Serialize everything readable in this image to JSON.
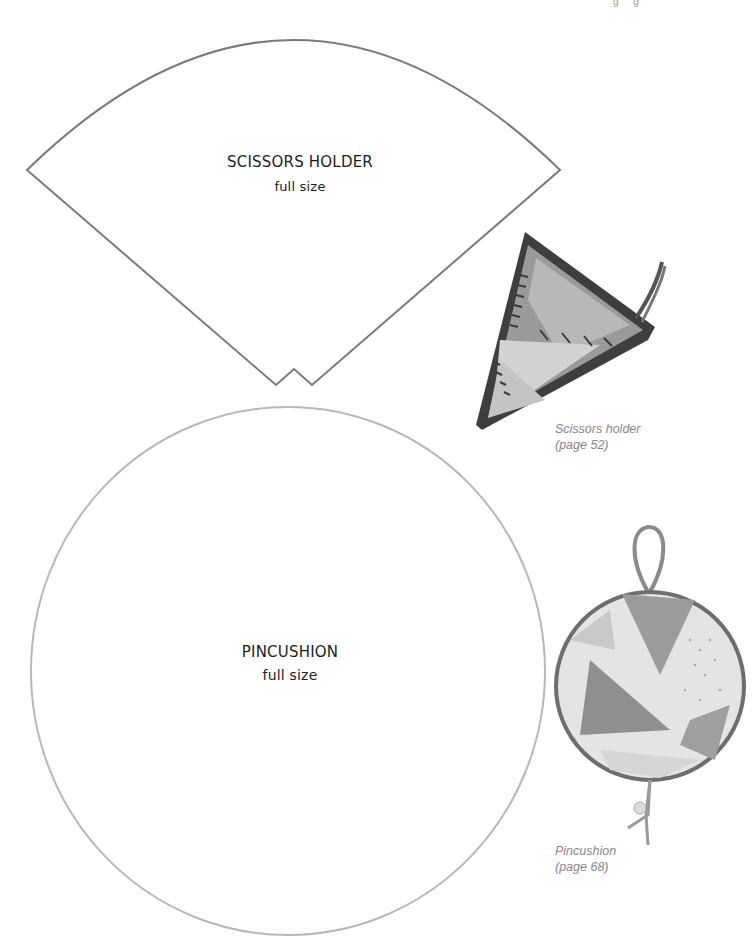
{
  "page": {
    "top_fragment": "g g",
    "line_color": "#7a7a7a",
    "circle_line_color": "#b5b5b5"
  },
  "scissors_template": {
    "title": "SCISSORS HOLDER",
    "subtitle": "full size"
  },
  "pincushion_template": {
    "title": "PINCUSHION",
    "subtitle": "full size"
  },
  "photos": [
    {
      "subject": "scissors-holder-photo",
      "caption_line1": "Scissors holder",
      "caption_line2": "(page 52)"
    },
    {
      "subject": "pincushion-photo",
      "caption_line1": "Pincushion",
      "caption_line2": "(page 68)"
    }
  ]
}
